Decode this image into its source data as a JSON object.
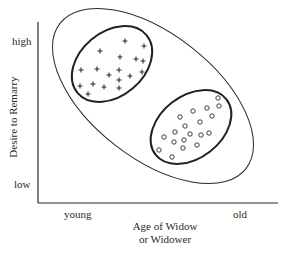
{
  "diagram": {
    "y_axis": {
      "label": "Desire to Remarry",
      "high_label": "high",
      "low_label": "low"
    },
    "x_axis": {
      "label_line1": "Age of Widow",
      "label_line2": "or Widower",
      "young_label": "young",
      "old_label": "old"
    },
    "clusters": [
      {
        "name": "young-high-desire",
        "marker": "plus",
        "count": 18
      },
      {
        "name": "old-low-desire",
        "marker": "circle",
        "count": 19
      }
    ],
    "colors": {
      "ink": "#2a2a2a",
      "background": "#ffffff"
    }
  }
}
